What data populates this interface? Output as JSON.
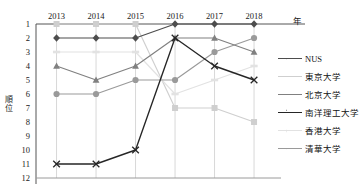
{
  "chart_data": {
    "type": "line",
    "title": "",
    "xlabel": "年",
    "ylabel": "順位",
    "categories": [
      "2013",
      "2014",
      "2015",
      "2016",
      "2017",
      "2018"
    ],
    "ylim": [
      1,
      12
    ],
    "y_inverted": true,
    "yticks": [
      "1",
      "2",
      "3",
      "4",
      "5",
      "6",
      "7",
      "8",
      "9",
      "10",
      "11",
      "12"
    ],
    "grid": "vertical",
    "legend_position": "right",
    "series": [
      {
        "name": "NUS",
        "values": [
          2,
          2,
          2,
          1,
          1,
          1
        ],
        "color": "#4d4d4d",
        "marker": "diamond"
      },
      {
        "name": "東京大学",
        "values": [
          1,
          1,
          1,
          7,
          7,
          8
        ],
        "color": "#cfcfcf",
        "marker": "square"
      },
      {
        "name": "北京大学",
        "values": [
          4,
          5,
          4,
          2,
          2,
          3
        ],
        "color": "#808080",
        "marker": "triangle"
      },
      {
        "name": "南洋理工大学",
        "values": [
          11,
          11,
          10,
          2,
          4,
          5
        ],
        "color": "#262626",
        "marker": "x"
      },
      {
        "name": "香港大学",
        "values": [
          3,
          3,
          3,
          6,
          5,
          4
        ],
        "color": "#e2e2e2",
        "marker": "dash"
      },
      {
        "name": "清華大学",
        "values": [
          6,
          6,
          5,
          5,
          3,
          2
        ],
        "color": "#9a9a9a",
        "marker": "circle"
      }
    ]
  },
  "axes": {
    "y_title": "順位",
    "x_title": "年"
  }
}
